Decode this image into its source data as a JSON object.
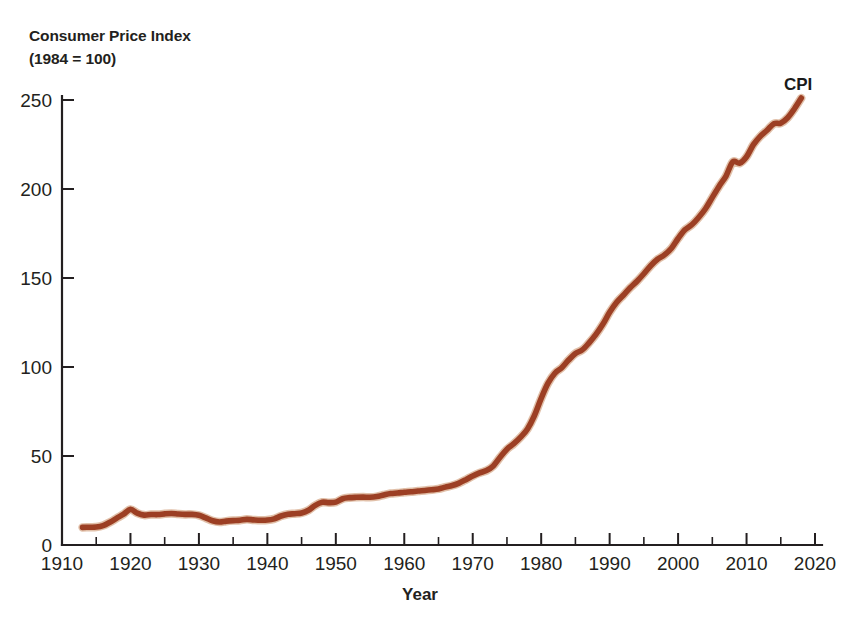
{
  "title": {
    "line1": "Consumer Price Index",
    "line2": "(1984 = 100)"
  },
  "axes": {
    "x_title": "Year",
    "y_title": ""
  },
  "colors": {
    "line": "#9c3f24",
    "line_highlight": "#c98d63",
    "axis": "#231f20",
    "text": "#231f20",
    "background": "#ffffff"
  },
  "labels": {
    "series": "CPI"
  },
  "chart_data": {
    "type": "line",
    "title": "Consumer Price Index (1984 = 100)",
    "subtitle": "",
    "xlabel": "Year",
    "ylabel": "Consumer Price Index (1984 = 100)",
    "xlim": [
      1910,
      2020
    ],
    "ylim": [
      0,
      260
    ],
    "xticks": [
      1910,
      1920,
      1930,
      1940,
      1950,
      1960,
      1970,
      1980,
      1990,
      2000,
      2010,
      2020
    ],
    "xtick_labels": [
      "1910",
      "1920",
      "1930",
      "1940",
      "1950",
      "1960",
      "1970",
      "1980",
      "1990",
      "2000",
      "2010",
      "2020"
    ],
    "x_minor_ticks": [
      1915,
      1925,
      1935,
      1945,
      1955,
      1965,
      1975,
      1985,
      1995,
      2005,
      2015
    ],
    "yticks": [
      0,
      50,
      100,
      150,
      200,
      250
    ],
    "ytick_labels": [
      "0",
      "50",
      "100",
      "150",
      "200",
      "250"
    ],
    "grid": false,
    "legend": "inline-end-label",
    "legend_position": "top-right",
    "annotations": [
      {
        "text": "CPI",
        "x": 2019,
        "y": 253
      }
    ],
    "series": [
      {
        "name": "CPI",
        "color": "#9c3f24",
        "x": [
          1913,
          1914,
          1915,
          1916,
          1917,
          1918,
          1919,
          1920,
          1921,
          1922,
          1923,
          1924,
          1925,
          1926,
          1927,
          1928,
          1929,
          1930,
          1931,
          1932,
          1933,
          1934,
          1935,
          1936,
          1937,
          1938,
          1939,
          1940,
          1941,
          1942,
          1943,
          1944,
          1945,
          1946,
          1947,
          1948,
          1949,
          1950,
          1951,
          1952,
          1953,
          1954,
          1955,
          1956,
          1957,
          1958,
          1959,
          1960,
          1961,
          1962,
          1963,
          1964,
          1965,
          1966,
          1967,
          1968,
          1969,
          1970,
          1971,
          1972,
          1973,
          1974,
          1975,
          1976,
          1977,
          1978,
          1979,
          1980,
          1981,
          1982,
          1983,
          1984,
          1985,
          1986,
          1987,
          1988,
          1989,
          1990,
          1991,
          1992,
          1993,
          1994,
          1995,
          1996,
          1997,
          1998,
          1999,
          2000,
          2001,
          2002,
          2003,
          2004,
          2005,
          2006,
          2007,
          2008,
          2009,
          2010,
          2011,
          2012,
          2013,
          2014,
          2015,
          2016,
          2017,
          2018
        ],
        "values": [
          9.9,
          10.0,
          10.1,
          10.9,
          12.8,
          15.1,
          17.3,
          20.0,
          17.9,
          16.8,
          17.1,
          17.1,
          17.5,
          17.7,
          17.4,
          17.2,
          17.2,
          16.7,
          15.2,
          13.6,
          12.9,
          13.4,
          13.7,
          13.9,
          14.4,
          14.1,
          13.9,
          14.0,
          14.7,
          16.3,
          17.3,
          17.6,
          18.0,
          19.5,
          22.3,
          24.0,
          23.8,
          24.1,
          26.0,
          26.6,
          26.8,
          26.9,
          26.8,
          27.2,
          28.1,
          28.9,
          29.2,
          29.6,
          29.9,
          30.3,
          30.6,
          31.0,
          31.5,
          32.5,
          33.4,
          34.8,
          36.7,
          38.8,
          40.5,
          41.8,
          44.4,
          49.3,
          53.8,
          56.9,
          60.6,
          65.2,
          72.6,
          82.4,
          90.9,
          96.5,
          99.6,
          103.9,
          107.6,
          109.6,
          113.6,
          118.3,
          124.0,
          130.7,
          136.2,
          140.3,
          144.5,
          148.2,
          152.4,
          156.9,
          160.5,
          163.0,
          166.6,
          172.2,
          177.1,
          179.9,
          184.0,
          188.9,
          195.3,
          201.6,
          207.3,
          215.3,
          214.5,
          218.1,
          224.9,
          229.6,
          233.0,
          236.7,
          237.0,
          240.0,
          245.1,
          251.1
        ]
      }
    ]
  }
}
